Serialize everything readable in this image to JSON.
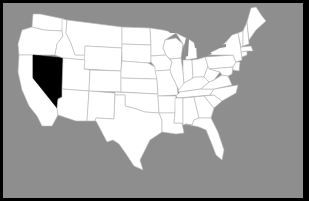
{
  "map": {
    "title": "",
    "region": "United States (contiguous)",
    "colors": {
      "frame": "#000000",
      "background": "#8e8e8e",
      "state_fill": "#ffffff",
      "state_border": "#b9b9b9",
      "highlight_fill": "#000000"
    },
    "highlighted_state": "NV",
    "states": [
      {
        "id": "WA",
        "points": "33,14 32,27 44,30 62,31 64,19 40,14"
      },
      {
        "id": "OR",
        "points": "22,30 32,27 44,30 62,31 63,36 57,44 55,55 33,55 19,55 18,44"
      },
      {
        "id": "CA",
        "points": "19,55 33,55 33,78 57,103 57,108 58,115 52,126 42,126 37,116 29,106 22,90 18,72"
      },
      {
        "id": "NV",
        "points": "33,55 63,58 62,97 58,99 57,108 33,78"
      },
      {
        "id": "ID",
        "points": "62,19 67,20 66,33 71,43 75,55 85,55 85,60 63,58 55,55 57,44 63,36 62,31"
      },
      {
        "id": "MT",
        "points": "67,20 122,27 122,48 85,46 85,55 75,55 71,43 66,33"
      },
      {
        "id": "WY",
        "points": "85,46 122,48 121,71 84,69"
      },
      {
        "id": "UT",
        "points": "63,58 85,60 84,69 90,70 89,91 62,89"
      },
      {
        "id": "AZ",
        "points": "62,89 89,91 87,121 76,121 58,115 57,108 58,99 62,97"
      },
      {
        "id": "CO",
        "points": "90,70 121,71 121,92 89,91"
      },
      {
        "id": "NM",
        "points": "89,91 115,93 114,119 96,118 95,121 87,121"
      },
      {
        "id": "ND",
        "points": "122,27 150,28 151,45 122,44"
      },
      {
        "id": "SD",
        "points": "122,44 151,45 151,62 148,63 122,61"
      },
      {
        "id": "NE",
        "points": "122,61 148,63 155,67 157,79 121,78 121,71"
      },
      {
        "id": "KS",
        "points": "121,78 157,79 158,94 121,92"
      },
      {
        "id": "OK",
        "points": "115,92 158,94 159,113 145,112 133,108 125,106 125,95 115,95"
      },
      {
        "id": "TX",
        "points": "115,95 125,95 125,106 133,108 145,112 159,113 162,120 162,132 150,140 145,150 140,160 143,170 134,166 126,154 119,144 113,140 107,142 96,121 95,121 96,118 114,119"
      },
      {
        "id": "MN",
        "points": "150,28 163,30 176,33 165,40 163,48 166,55 151,56 151,45"
      },
      {
        "id": "IA",
        "points": "151,56 166,55 172,62 170,70 155,71 155,67 151,62"
      },
      {
        "id": "MO",
        "points": "155,71 170,70 172,76 177,86 178,95 158,96 158,94 157,79"
      },
      {
        "id": "AR",
        "points": "158,96 176,96 175,113 159,113"
      },
      {
        "id": "LA",
        "points": "159,113 175,113 174,123 182,123 184,133 176,134 162,132 162,120"
      },
      {
        "id": "WI",
        "points": "165,40 176,38 183,44 181,58 170,59 166,55 163,48"
      },
      {
        "id": "IL",
        "points": "170,59 181,58 183,71 184,83 180,93 177,86 172,76 170,70 172,62"
      },
      {
        "id": "MI",
        "points": "176,33 190,40 196,44 197,58 186,60 185,50 183,44"
      },
      {
        "id": "IN",
        "points": "183,60 192,60 193,78 184,83 183,71"
      },
      {
        "id": "OH",
        "points": "192,60 199,59 205,57 208,66 204,77 195,77 193,78"
      },
      {
        "id": "KY",
        "points": "178,91 184,83 193,78 195,77 204,77 209,82 201,89 180,92"
      },
      {
        "id": "TN",
        "points": "176,96 180,92 201,89 214,89 210,95 178,98"
      },
      {
        "id": "MS",
        "points": "175,98 183,98 183,125 182,123 174,123 175,113"
      },
      {
        "id": "AL",
        "points": "183,98 194,97 199,118 194,120 192,125 186,124 183,125"
      },
      {
        "id": "GA",
        "points": "194,97 204,96 214,108 211,118 199,118"
      },
      {
        "id": "FL",
        "points": "186,124 192,125 194,120 199,118 211,118 218,132 224,150 222,160 216,155 211,142 206,130 199,127"
      },
      {
        "id": "SC",
        "points": "204,96 214,95 222,101 214,108"
      },
      {
        "id": "NC",
        "points": "210,95 214,89 238,85 236,93 222,101 214,95"
      },
      {
        "id": "VA",
        "points": "201,89 209,82 214,80 222,75 228,76 232,85 214,89"
      },
      {
        "id": "WV",
        "points": "204,77 208,66 213,70 220,72 214,80 209,82"
      },
      {
        "id": "PA",
        "points": "205,57 233,55 236,62 233,67 209,69 208,66"
      },
      {
        "id": "MD",
        "points": "209,69 233,67 232,74 228,76 222,75 220,72 213,70"
      },
      {
        "id": "NY",
        "points": "205,55 218,49 226,42 232,35 238,33 241,49 242,60 236,62 233,55"
      },
      {
        "id": "NJ",
        "points": "236,62 240,62 239,71 233,70 233,67"
      },
      {
        "id": "CT",
        "points": "241,52 247,51 247,55 242,57"
      },
      {
        "id": "MA",
        "points": "241,47 251,46 253,51 247,51 241,52"
      },
      {
        "id": "VT",
        "points": "238,33 243,31 243,46 241,47"
      },
      {
        "id": "NH",
        "points": "243,31 247,22 249,44 243,46"
      },
      {
        "id": "ME",
        "points": "247,22 251,8 256,7 262,16 266,21 256,30 249,40"
      }
    ],
    "lakes": [
      {
        "id": "lake-superior",
        "points": "166,28 176,27 190,30 196,34 190,36 178,33 170,33"
      },
      {
        "id": "lake-michigan",
        "points": "186,38 189,39 188,56 185,57 184,46"
      },
      {
        "id": "lake-huron",
        "points": "193,37 200,40 199,48 195,48"
      },
      {
        "id": "lake-erie",
        "points": "198,56 210,52 212,54 200,58"
      },
      {
        "id": "lake-ontario",
        "points": "215,46 226,44 226,47 215,49"
      }
    ]
  }
}
